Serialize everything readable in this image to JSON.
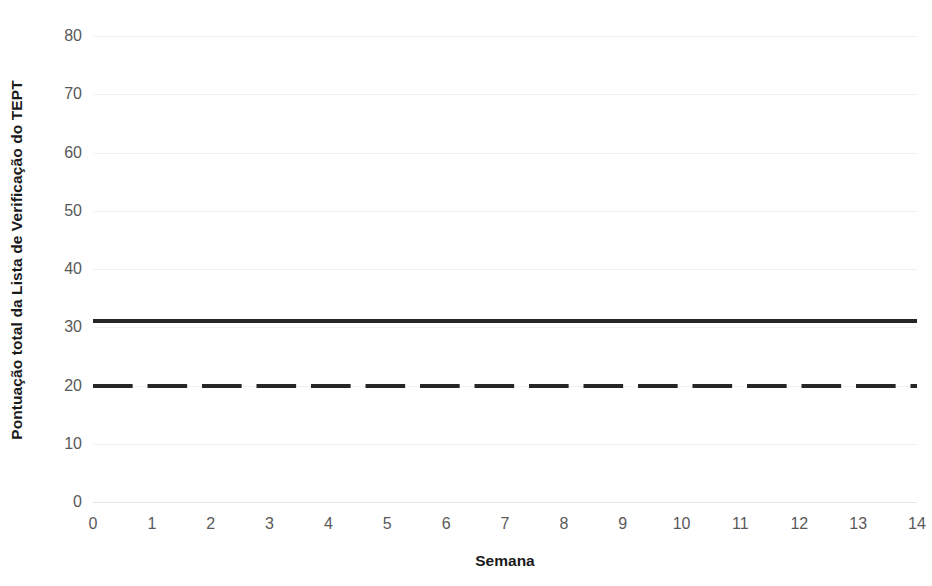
{
  "chart_data": {
    "type": "line",
    "title": "",
    "subtitle": "",
    "xlabel": "Semana",
    "ylabel": "Pontuação total da Lista de Verificação do TEPT",
    "x": [
      0,
      1,
      2,
      3,
      4,
      5,
      6,
      7,
      8,
      9,
      10,
      11,
      12,
      13,
      14
    ],
    "xtick_labels": [
      "0",
      "1",
      "2",
      "3",
      "4",
      "5",
      "6",
      "7",
      "8",
      "9",
      "10",
      "11",
      "12",
      "13",
      "14"
    ],
    "xlim": [
      0,
      14
    ],
    "ylim": [
      0,
      80
    ],
    "ytick_values": [
      0,
      10,
      20,
      30,
      40,
      50,
      60,
      70,
      80
    ],
    "ytick_labels": [
      "0",
      "10",
      "20",
      "30",
      "40",
      "50",
      "60",
      "70",
      "80"
    ],
    "grid": "horizontal",
    "legend": "none",
    "series": [
      {
        "name": "solid-threshold-line",
        "style": "solid",
        "color": "#262626",
        "constant_value": 31,
        "values": [
          31,
          31,
          31,
          31,
          31,
          31,
          31,
          31,
          31,
          31,
          31,
          31,
          31,
          31,
          31
        ]
      },
      {
        "name": "dashed-threshold-line",
        "style": "dashed",
        "color": "#262626",
        "constant_value": 20,
        "values": [
          20,
          20,
          20,
          20,
          20,
          20,
          20,
          20,
          20,
          20,
          20,
          20,
          20,
          20,
          20
        ]
      }
    ],
    "colors": {
      "line": "#262626",
      "gridline": "#f0f0f0",
      "tick_label": "#595959",
      "axis_title": "#1a1a1a",
      "background": "#ffffff"
    }
  }
}
